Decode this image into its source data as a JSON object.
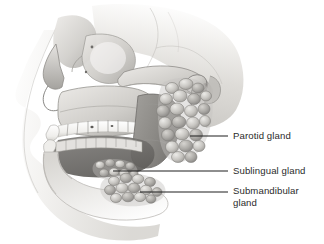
{
  "figure": {
    "background_color": "#ffffff",
    "width": 324,
    "height": 244
  },
  "palette": {
    "bone_light": "#f2f1ef",
    "bone_mid": "#d2d0cc",
    "bone_shadow": "#a8a6a2",
    "bone_dark": "#8a8884",
    "cavity_dark": "#6f6d6a",
    "gland_light": "#dedcd8",
    "gland_mid": "#b6b4b0",
    "gland_outline": "#7d7b77",
    "tooth": "#f7f6f3",
    "leader_line": "#1f1f1f",
    "label_text": "#2b2b2b"
  },
  "labels": [
    {
      "id": "parotid",
      "text": "Parotid gland",
      "leader": {
        "x1": 190,
        "y1": 136,
        "x2": 228,
        "y2": 136
      }
    },
    {
      "id": "sublingual",
      "text": "Sublingual gland",
      "leader": {
        "x1": 113,
        "y1": 171,
        "x2": 228,
        "y2": 171
      }
    },
    {
      "id": "submandibular",
      "text": "Submandibular\ngland",
      "leader": {
        "x1": 140,
        "y1": 192,
        "x2": 228,
        "y2": 192
      }
    }
  ],
  "anatomy": {
    "structures": [
      "cranium",
      "frontal bone",
      "nasal bone",
      "orbit",
      "zygomatic arch",
      "maxilla",
      "maxillary teeth",
      "mandible",
      "mandibular teeth",
      "mandibular ramus",
      "mandibular condyle",
      "external acoustic meatus",
      "soft tissue facial profile",
      "parotid gland",
      "sublingual gland",
      "submandibular gland"
    ]
  }
}
